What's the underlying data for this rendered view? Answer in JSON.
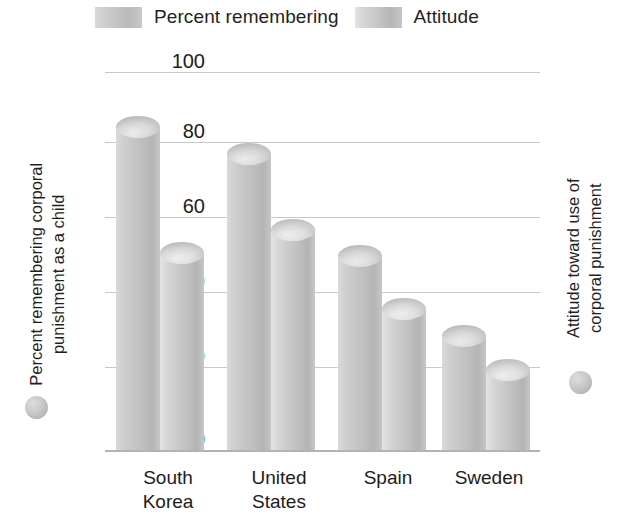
{
  "chart_data": {
    "type": "bar",
    "title": "",
    "categories": [
      "South Korea",
      "United States",
      "Spain",
      "Sweden"
    ],
    "series": [
      {
        "name": "Percent remembering",
        "axis": "left",
        "color": "#c6c6c6",
        "values": [
          88,
          81,
          54,
          33
        ]
      },
      {
        "name": "Attitude",
        "axis": "right",
        "color": "#c9c9c9",
        "values": [
          2.75,
          3.05,
          2.0,
          1.2
        ]
      }
    ],
    "xlabel": "",
    "ylabel": "Percent remembering corporal punishment as a child",
    "y2label": "Attitude toward use of corporal punishment",
    "ylim": [
      0,
      100
    ],
    "y2lim": [
      0,
      5
    ],
    "yticks": [
      "100",
      "80",
      "60",
      "40",
      "20",
      "0"
    ],
    "y2ticks": [
      "5",
      "4",
      "3",
      "2",
      "1",
      "0"
    ],
    "grid": true,
    "legend_position": "top"
  },
  "legend": {
    "entries": [
      {
        "label": "Percent remembering",
        "swatch": "legend-swatch-percent-remembering"
      },
      {
        "label": "Attitude",
        "swatch": "legend-swatch-attitude"
      }
    ]
  },
  "axes": {
    "left": {
      "title_line1": "Percent remembering corporal",
      "title_line2": "punishment as a child",
      "ticks": [
        "100",
        "80",
        "60",
        "40",
        "20",
        "0"
      ],
      "marker": "gray-circle"
    },
    "right": {
      "title_line1": "Attitude toward use of",
      "title_line2": "corporal punishment",
      "ticks": [
        "5",
        "4",
        "3",
        "2",
        "1",
        "0"
      ],
      "marker": "gray-circle"
    }
  },
  "xaxis": {
    "labels": [
      {
        "line1": "South",
        "line2": "Korea"
      },
      {
        "line1": "United",
        "line2": "States"
      },
      {
        "line1": "Spain",
        "line2": ""
      },
      {
        "line1": "Sweden",
        "line2": ""
      }
    ]
  },
  "colors": {
    "series1": "#c6c6c6",
    "series2": "#c9c9c9",
    "gridline": "#c9c9c9",
    "text": "#1c1c1c"
  }
}
